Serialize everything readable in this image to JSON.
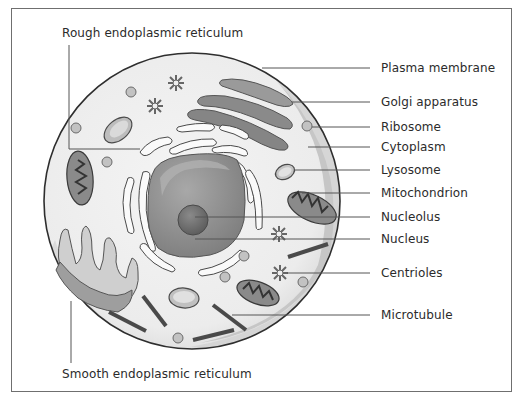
{
  "diagram": {
    "labels": {
      "rough_er": "Rough endoplasmic reticulum",
      "smooth_er": "Smooth endoplasmic reticulum",
      "plasma_membrane": "Plasma membrane",
      "golgi": "Golgi apparatus",
      "ribosome": "Ribosome",
      "cytoplasm": "Cytoplasm",
      "lysosome": "Lysosome",
      "mitochondrion": "Mitochondrion",
      "nucleolus": "Nucleolus",
      "nucleus": "Nucleus",
      "centrioles": "Centrioles",
      "microtubule": "Microtubule"
    },
    "colors": {
      "frame": "#6f6f6f",
      "membrane_outline": "#3a3a3a",
      "cytoplasm_fill": "#efefef",
      "cytoplasm_rim": "#cfcfcf",
      "nucleus_fill": "#8e8e8e",
      "nucleolus_fill": "#6d6d6d",
      "organelle_dark": "#7a7a7a",
      "leader_line": "#555555",
      "text": "#2b2b2b"
    }
  }
}
